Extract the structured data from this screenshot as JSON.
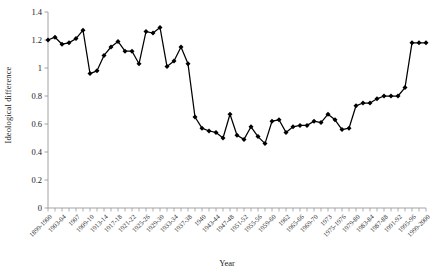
{
  "chart_data": {
    "type": "line",
    "title": "",
    "xlabel": "Year",
    "ylabel": "Ideological difference",
    "ylim": [
      0,
      1.4
    ],
    "yticks": [
      0,
      0.2,
      0.4,
      0.6,
      0.8,
      1,
      1.2,
      1.4
    ],
    "ytick_labels": [
      "0",
      "0.2",
      "0.4",
      "0.6",
      "0.8",
      "1",
      "1.2",
      "1.4"
    ],
    "grid": false,
    "legend": "none",
    "marker": "diamond",
    "line_color": "#000000",
    "marker_color": "#000000",
    "axis_color": "#9a9a9a",
    "categories": [
      "1899-1900",
      "1901-02",
      "1903-04",
      "1905-06",
      "1907",
      "1908",
      "1909-10",
      "1911-12",
      "1913-14",
      "1915-16",
      "1917-18",
      "1919-20",
      "1921-22",
      "1923-24",
      "1925-26",
      "1927-28",
      "1929-30",
      "1931-32",
      "1933-34",
      "1935-36",
      "1937-38",
      "1939",
      "1940",
      "1941-42",
      "1943-44",
      "1945-46",
      "1947-48",
      "1949-50",
      "1951-52",
      "1953-54",
      "1955-56",
      "1957-58",
      "1959-60",
      "1961",
      "1962",
      "1963-64",
      "1965-66",
      "1967-68",
      "1969-70",
      "1971-72",
      "1973",
      "1974",
      "1975-1976",
      "1977-78",
      "1979-80",
      "1981-82",
      "1983-84",
      "1985-86",
      "1987-88",
      "1989-90",
      "1991-92",
      "1993-94",
      "1995-96",
      "1997-98",
      "1999-2000"
    ],
    "xtick_labels": [
      "1899-1900",
      "1903-04",
      "1907",
      "1909-10",
      "1913-14",
      "1917-18",
      "1921-22",
      "1925-26",
      "1929-30",
      "1933-34",
      "1937-38",
      "1940",
      "1943-44",
      "1947-48",
      "1951-52",
      "1955-56",
      "1959-60",
      "1962",
      "1965-66",
      "1969-70",
      "1973",
      "1975-1976",
      "1979-80",
      "1983-84",
      "1987-88",
      "1991-92",
      "1995-96",
      "1999-2000"
    ],
    "xtick_label_indices": [
      0,
      2,
      4,
      6,
      8,
      10,
      12,
      14,
      16,
      18,
      20,
      22,
      24,
      26,
      28,
      30,
      32,
      34,
      36,
      38,
      40,
      42,
      44,
      46,
      48,
      50,
      52,
      54
    ],
    "values": [
      1.2,
      1.22,
      1.17,
      1.18,
      1.21,
      1.27,
      0.96,
      0.98,
      1.09,
      1.15,
      1.19,
      1.12,
      1.12,
      1.03,
      1.26,
      1.25,
      1.29,
      1.01,
      1.05,
      1.15,
      1.03,
      0.65,
      0.57,
      0.55,
      0.54,
      0.5,
      0.67,
      0.52,
      0.49,
      0.58,
      0.51,
      0.46,
      0.62,
      0.63,
      0.54,
      0.58,
      0.59,
      0.59,
      0.62,
      0.61,
      0.67,
      0.63,
      0.56,
      0.57,
      0.73,
      0.75,
      0.75,
      0.78,
      0.8,
      0.8,
      0.8,
      0.86,
      1.18,
      1.18,
      1.18
    ]
  }
}
